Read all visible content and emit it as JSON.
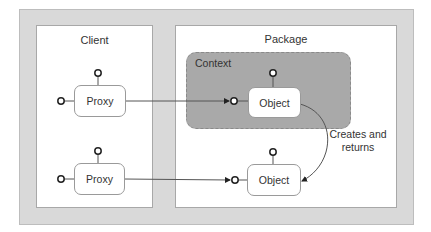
{
  "diagram": {
    "panels": {
      "client": {
        "title": "Client"
      },
      "package": {
        "title": "Package"
      }
    },
    "context": {
      "label": "Context"
    },
    "nodes": [
      {
        "id": "proxy-1",
        "label": "Proxy",
        "panel": "client"
      },
      {
        "id": "proxy-2",
        "label": "Proxy",
        "panel": "client"
      },
      {
        "id": "object-1",
        "label": "Object",
        "panel": "package",
        "in_context": true
      },
      {
        "id": "object-2",
        "label": "Object",
        "panel": "package",
        "in_context": false
      }
    ],
    "edges": [
      {
        "from": "proxy-1",
        "to": "object-1",
        "label": ""
      },
      {
        "from": "proxy-2",
        "to": "object-2",
        "label": ""
      },
      {
        "from": "object-1",
        "to": "object-2",
        "label": "Creates and returns",
        "label_lines": [
          "Creates and",
          "returns"
        ]
      }
    ],
    "colors": {
      "outer_background": "#d9d9d9",
      "panel_background": "#ffffff",
      "context_fill": "#a9a9a9",
      "line": "#555555"
    }
  }
}
